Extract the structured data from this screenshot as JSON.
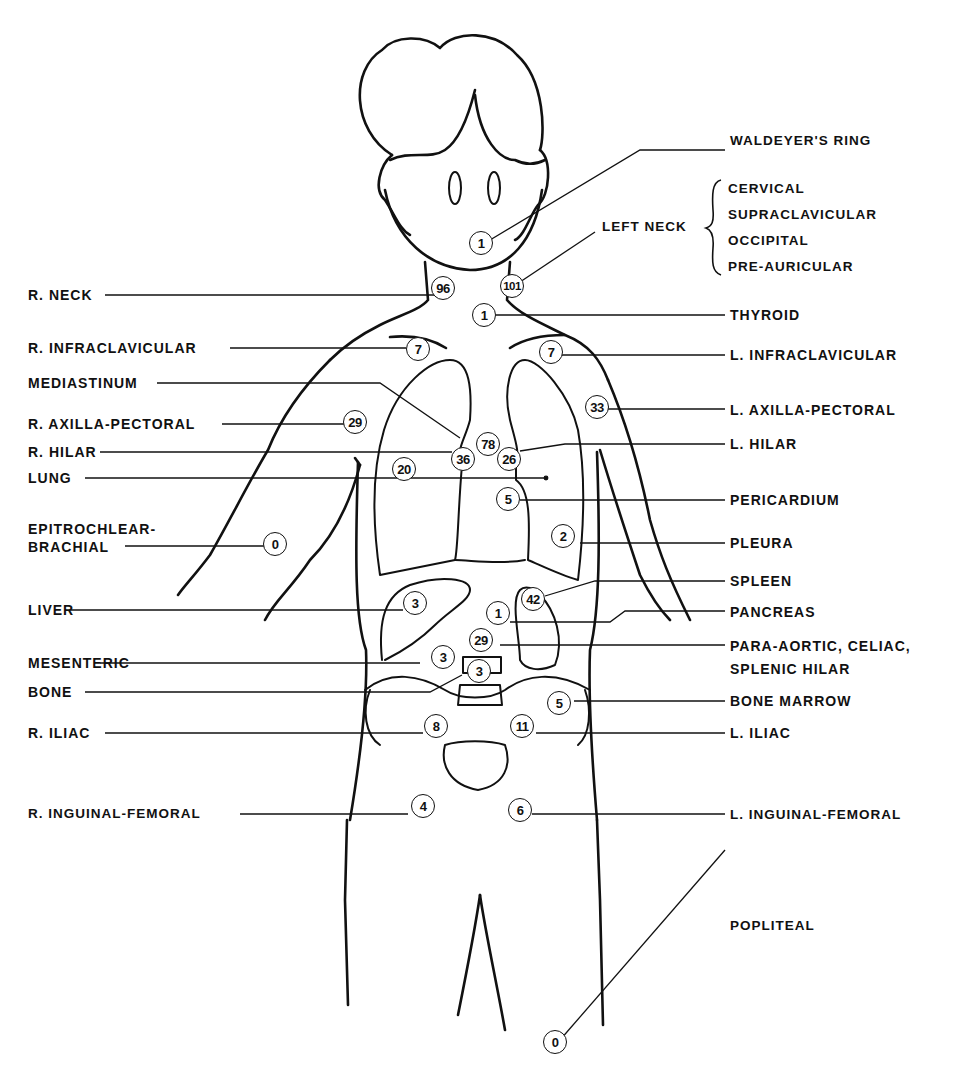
{
  "diagram": {
    "type": "anatomical lymph node site diagram",
    "brace_group": {
      "label": "LEFT NECK",
      "items": [
        "CERVICAL",
        "SUPRACLAVICULAR",
        "OCCIPITAL",
        "PRE-AURICULAR"
      ]
    },
    "sites": [
      {
        "label": "WALDEYER'S RING",
        "value": "1",
        "side": "right"
      },
      {
        "label": "LEFT NECK",
        "value": "101",
        "side": "right"
      },
      {
        "label": "R. NECK",
        "value": "96",
        "side": "left"
      },
      {
        "label": "THYROID",
        "value": "1",
        "side": "right"
      },
      {
        "label": "R. INFRACLAVICULAR",
        "value": "7",
        "side": "left"
      },
      {
        "label": "L. INFRACLAVICULAR",
        "value": "7",
        "side": "right"
      },
      {
        "label": "MEDIASTINUM",
        "value": "78",
        "side": "left"
      },
      {
        "label": "R. AXILLA-PECTORAL",
        "value": "29",
        "side": "left"
      },
      {
        "label": "L. AXILLA-PECTORAL",
        "value": "33",
        "side": "right"
      },
      {
        "label": "R. HILAR",
        "value": "36",
        "side": "left"
      },
      {
        "label": "L. HILAR",
        "value": "26",
        "side": "right"
      },
      {
        "label": "LUNG",
        "value": "20",
        "side": "left"
      },
      {
        "label": "PERICARDIUM",
        "value": "5",
        "side": "right"
      },
      {
        "label": "EPITROCHLEAR-",
        "label2": "BRACHIAL",
        "value": "0",
        "side": "left"
      },
      {
        "label": "PLEURA",
        "value": "2",
        "side": "right"
      },
      {
        "label": "SPLEEN",
        "value": "42",
        "side": "right"
      },
      {
        "label": "LIVER",
        "value": "3",
        "side": "left"
      },
      {
        "label": "PANCREAS",
        "value": "1",
        "side": "right"
      },
      {
        "label": "PARA-AORTIC, CELIAC,",
        "label2": "SPLENIC HILAR",
        "value": "29",
        "side": "right"
      },
      {
        "label": "MESENTERIC",
        "value": "3",
        "side": "left"
      },
      {
        "label": "BONE",
        "value": "3",
        "side": "left"
      },
      {
        "label": "BONE MARROW",
        "value": "5",
        "side": "right"
      },
      {
        "label": "R. ILIAC",
        "value": "8",
        "side": "left"
      },
      {
        "label": "L. ILIAC",
        "value": "11",
        "side": "right"
      },
      {
        "label": "R. INGUINAL-FEMORAL",
        "value": "4",
        "side": "left"
      },
      {
        "label": "L. INGUINAL-FEMORAL",
        "value": "6",
        "side": "right"
      },
      {
        "label": "POPLITEAL",
        "value": "0",
        "side": "right"
      }
    ]
  }
}
